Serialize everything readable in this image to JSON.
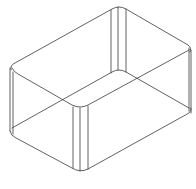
{
  "figure": {
    "view": "isometric",
    "colors": {
      "background": "#ffffff",
      "line": "#3a3a3a"
    }
  }
}
